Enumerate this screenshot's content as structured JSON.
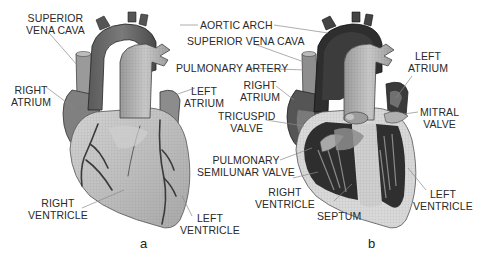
{
  "figure": {
    "panels": [
      {
        "id": "a",
        "letter": "a",
        "view": "exterior",
        "labels": {
          "superior_vena_cava_1": "SUPERIOR",
          "superior_vena_cava_2": "VENA CAVA",
          "right_atrium_1": "RIGHT",
          "right_atrium_2": "ATRIUM",
          "left_atrium_1": "LEFT",
          "left_atrium_2": "ATRIUM",
          "right_ventricle_1": "RIGHT",
          "right_ventricle_2": "VENTRICLE",
          "left_ventricle_1": "LEFT",
          "left_ventricle_2": "VENTRICLE"
        }
      },
      {
        "id": "b",
        "letter": "b",
        "view": "cross-section",
        "labels": {
          "aortic_arch": "AORTIC ARCH",
          "superior_vena_cava": "SUPERIOR VENA CAVA",
          "pulmonary_artery": "PULMONARY ARTERY",
          "left_atrium_1": "LEFT",
          "left_atrium_2": "ATRIUM",
          "right_atrium_1": "RIGHT",
          "right_atrium_2": "ATRIUM",
          "tricuspid_valve_1": "TRICUSPID",
          "tricuspid_valve_2": "VALVE",
          "mitral_valve_1": "MITRAL",
          "mitral_valve_2": "VALVE",
          "pulmonary_semilunar_valve_1": "PULMONARY",
          "pulmonary_semilunar_valve_2": "SEMILUNAR VALVE",
          "right_ventricle_1": "RIGHT",
          "right_ventricle_2": "VENTRICLE",
          "septum": "SEPTUM",
          "left_ventricle_1": "LEFT",
          "left_ventricle_2": "VENTRICLE"
        }
      }
    ]
  }
}
